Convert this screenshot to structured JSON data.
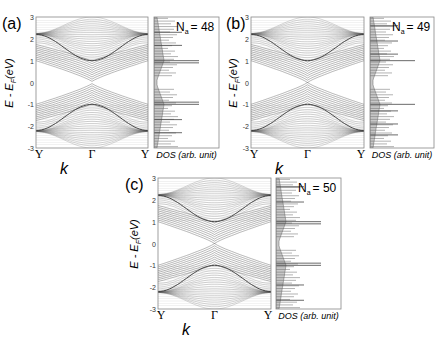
{
  "figure": {
    "common": {
      "ylabel": "E - E_F (eV)",
      "ylabel_main": "E - E",
      "ylabel_sub": "F",
      "ylabel_unit": "(eV)",
      "xlabel": "k",
      "xticks": [
        "Y",
        "Γ",
        "Y"
      ],
      "yticks": [
        "3",
        "2",
        "1",
        "0",
        "-1",
        "-2",
        "-3"
      ],
      "dos_label": "DOS (arb. unit)",
      "ylim": [
        -3,
        3
      ]
    },
    "colors": {
      "band_line": "#555555",
      "band_edge": "#3a3a3a",
      "dos_fill": "#c8c8c8",
      "dos_line": "#666666",
      "axis": "#777777"
    }
  },
  "chart_data": [
    {
      "type": "line",
      "panel": "(a)",
      "title": "(a)",
      "annotation": "N_a = 48",
      "annotation_main": "N",
      "annotation_sub": "a",
      "annotation_value": "= 48",
      "xlabel": "k",
      "ylabel": "E - E_F (eV)",
      "x_ticks": [
        "Y",
        "Γ",
        "Y"
      ],
      "y_ticks": [
        3,
        2,
        1,
        0,
        -1,
        -2,
        -3
      ],
      "ylim": [
        -3,
        3
      ],
      "band_gap_at_gamma_eV": 0.1,
      "band_summary": {
        "conduction_bundle_top_at_Y": 2.2,
        "conduction_bundle_bottom_at_Gamma": 0.05,
        "inner_band_at_Gamma": 1.0,
        "outer_band_max_at_Gamma": 3.0,
        "valence_mirror": true
      },
      "dos_peaks_eV": [
        1.0,
        0.9,
        -0.9,
        -1.0,
        1.7,
        -1.7,
        2.3,
        -2.3
      ],
      "dos_label": "DOS (arb. unit)"
    },
    {
      "type": "line",
      "panel": "(b)",
      "title": "(b)",
      "annotation": "N_a = 49",
      "annotation_main": "N",
      "annotation_sub": "a",
      "annotation_value": "= 49",
      "xlabel": "k",
      "ylabel": "E - E_F (eV)",
      "x_ticks": [
        "Y",
        "Γ",
        "Y"
      ],
      "y_ticks": [
        3,
        2,
        1,
        0,
        -1,
        -2,
        -3
      ],
      "ylim": [
        -3,
        3
      ],
      "band_gap_at_gamma_eV": 0.0,
      "band_summary": {
        "conduction_bundle_top_at_Y": 2.2,
        "conduction_bundle_bottom_at_Gamma": 0.0,
        "inner_band_at_Gamma": 1.0,
        "outer_band_max_at_Gamma": 3.0,
        "valence_mirror": true
      },
      "dos_peaks_eV": [
        1.0,
        -1.0,
        1.3,
        -1.3,
        2.6,
        1.9,
        -1.9,
        -2.4
      ],
      "dos_label": "DOS (arb. unit)"
    },
    {
      "type": "line",
      "panel": "(c)",
      "title": "(c)",
      "annotation": "N_a = 50",
      "annotation_main": "N",
      "annotation_sub": "a",
      "annotation_value": "= 50",
      "xlabel": "k",
      "ylabel": "E - E_F (eV)",
      "x_ticks": [
        "Y",
        "Γ",
        "Y"
      ],
      "y_ticks": [
        3,
        2,
        1,
        0,
        -1,
        -2,
        -3
      ],
      "ylim": [
        -3,
        3
      ],
      "band_gap_at_gamma_eV": 0.0,
      "band_summary": {
        "conduction_bundle_top_at_Y": 2.2,
        "conduction_bundle_bottom_at_Gamma": 0.0,
        "inner_band_at_Gamma": 1.0,
        "outer_band_max_at_Gamma": 3.0,
        "valence_mirror": true
      },
      "dos_peaks_eV": [
        1.0,
        0.9,
        -0.9,
        -1.0,
        1.9,
        -1.9,
        2.6,
        -2.6
      ],
      "dos_label": "DOS (arb. unit)"
    }
  ]
}
